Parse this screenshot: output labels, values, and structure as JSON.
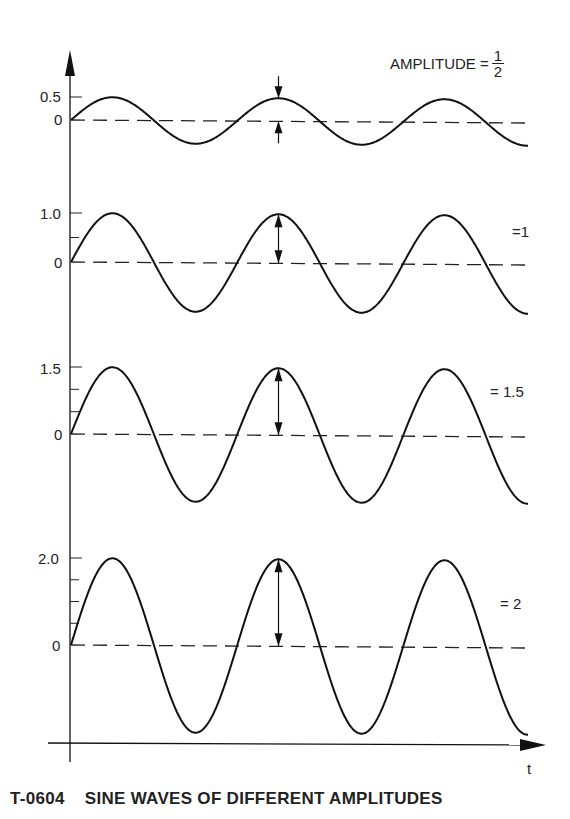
{
  "caption": {
    "id": "T-0604",
    "title": "SINE WAVES OF DIFFERENT AMPLITUDES"
  },
  "axis": {
    "x_label": "t"
  },
  "panels": [
    {
      "y_tick_label": "0.5",
      "zero_label": "0",
      "amplitude_label_prefix": "AMPLITUDE =",
      "amplitude_num": "1",
      "amplitude_den": "2"
    },
    {
      "y_tick_label": "1.0",
      "zero_label": "0",
      "amplitude_label": "=1"
    },
    {
      "y_tick_label": "1.5",
      "zero_label": "0",
      "amplitude_label": "= 1.5"
    },
    {
      "y_tick_label": "2.0",
      "zero_label": "0",
      "amplitude_label": "= 2"
    }
  ],
  "chart_data": {
    "type": "line",
    "title": "T-0604 SINE WAVES OF DIFFERENT AMPLITUDES",
    "xlabel": "t",
    "ylabel": "",
    "grid": false,
    "legend": "none",
    "x": "t (approx. 2.75 periods shown, starting at 0)",
    "series": [
      {
        "name": "AMPLITUDE = 1/2",
        "amplitude": 0.5,
        "periods": 2.75,
        "ylim": [
          -0.5,
          0.5
        ],
        "y_ticks": [
          "0",
          "0.5"
        ]
      },
      {
        "name": "= 1",
        "amplitude": 1.0,
        "periods": 2.75,
        "ylim": [
          -1,
          1
        ],
        "y_ticks": [
          "0",
          "1.0"
        ]
      },
      {
        "name": "= 1.5",
        "amplitude": 1.5,
        "periods": 2.75,
        "ylim": [
          -1.5,
          1.5
        ],
        "y_ticks": [
          "0",
          "1.5"
        ]
      },
      {
        "name": "= 2",
        "amplitude": 2.0,
        "periods": 2.75,
        "ylim": [
          -2,
          2
        ],
        "y_ticks": [
          "0",
          "2.0"
        ]
      }
    ],
    "annotations": [
      "double-headed arrow marking amplitude at second peak of each wave"
    ]
  }
}
